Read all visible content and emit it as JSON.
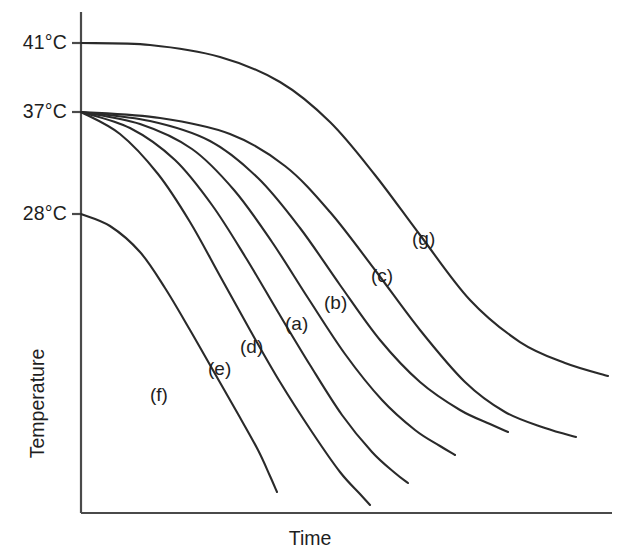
{
  "figure": {
    "background_color": "#ffffff",
    "line_color": "#2a2a2a",
    "axis_color": "#4a4a4a"
  },
  "axes": {
    "x_title": "Time",
    "y_title": "Temperature",
    "y_ticks": [
      {
        "label": "41°C",
        "y": 43
      },
      {
        "label": "37°C",
        "y": 112
      },
      {
        "label": "28°C",
        "y": 214
      }
    ]
  },
  "curve_labels": [
    {
      "name": "f",
      "text": "(f)",
      "x": 150,
      "y": 384
    },
    {
      "name": "e",
      "text": "(e)",
      "x": 208,
      "y": 358
    },
    {
      "name": "d",
      "text": "(d)",
      "x": 240,
      "y": 336
    },
    {
      "name": "a",
      "text": "(a)",
      "x": 285,
      "y": 313
    },
    {
      "name": "b",
      "text": "(b)",
      "x": 324,
      "y": 292
    },
    {
      "name": "c",
      "text": "(c)",
      "x": 371,
      "y": 265
    },
    {
      "name": "g",
      "text": "(g)",
      "x": 412,
      "y": 228
    }
  ],
  "chart_data": {
    "type": "line",
    "title": "",
    "xlabel": "Time",
    "ylabel": "Temperature",
    "grid": false,
    "legend": "inline-curve-labels",
    "x_axis": {
      "min_px": 81,
      "max_px": 612,
      "ticks": [],
      "note": "Time axis is unlabeled/qualitative"
    },
    "y_axis": {
      "tick_labels": [
        "41°C",
        "37°C",
        "28°C"
      ],
      "tick_values": [
        41,
        37,
        28
      ],
      "tick_pixels": [
        43,
        112,
        214
      ],
      "note": "Temperature axis, decreasing downward"
    },
    "series": [
      {
        "name": "g",
        "label": "(g)",
        "start_temp_label": "41°C",
        "start_temp": 41,
        "points_px": [
          [
            81,
            43
          ],
          [
            150,
            45
          ],
          [
            220,
            57
          ],
          [
            280,
            82
          ],
          [
            330,
            122
          ],
          [
            375,
            175
          ],
          [
            420,
            235
          ],
          [
            470,
            300
          ],
          [
            520,
            342
          ],
          [
            565,
            363
          ],
          [
            608,
            376
          ]
        ]
      },
      {
        "name": "c",
        "label": "(c)",
        "start_temp_label": "37°C",
        "start_temp": 37,
        "points_px": [
          [
            81,
            112
          ],
          [
            160,
            118
          ],
          [
            230,
            134
          ],
          [
            285,
            166
          ],
          [
            330,
            212
          ],
          [
            375,
            270
          ],
          [
            420,
            330
          ],
          [
            465,
            382
          ],
          [
            505,
            412
          ],
          [
            545,
            428
          ],
          [
            576,
            437
          ]
        ]
      },
      {
        "name": "b",
        "label": "(b)",
        "start_temp_label": "37°C",
        "start_temp": 37,
        "points_px": [
          [
            81,
            112
          ],
          [
            150,
            121
          ],
          [
            210,
            141
          ],
          [
            258,
            178
          ],
          [
            300,
            228
          ],
          [
            340,
            285
          ],
          [
            380,
            340
          ],
          [
            420,
            382
          ],
          [
            460,
            410
          ],
          [
            490,
            424
          ],
          [
            508,
            432
          ]
        ]
      },
      {
        "name": "a",
        "label": "(a)",
        "start_temp_label": "37°C",
        "start_temp": 37,
        "points_px": [
          [
            81,
            112
          ],
          [
            140,
            124
          ],
          [
            192,
            149
          ],
          [
            234,
            190
          ],
          [
            272,
            242
          ],
          [
            308,
            298
          ],
          [
            345,
            354
          ],
          [
            382,
            400
          ],
          [
            415,
            430
          ],
          [
            440,
            446
          ],
          [
            455,
            455
          ]
        ]
      },
      {
        "name": "d",
        "label": "(d)",
        "start_temp_label": "37°C",
        "start_temp": 37,
        "points_px": [
          [
            81,
            112
          ],
          [
            130,
            128
          ],
          [
            175,
            160
          ],
          [
            212,
            205
          ],
          [
            246,
            258
          ],
          [
            278,
            312
          ],
          [
            310,
            365
          ],
          [
            342,
            415
          ],
          [
            372,
            452
          ],
          [
            395,
            473
          ],
          [
            408,
            483
          ]
        ]
      },
      {
        "name": "e",
        "label": "(e)",
        "start_temp_label": "37°C",
        "start_temp": 37,
        "points_px": [
          [
            81,
            112
          ],
          [
            120,
            134
          ],
          [
            158,
            174
          ],
          [
            190,
            222
          ],
          [
            220,
            276
          ],
          [
            250,
            330
          ],
          [
            280,
            382
          ],
          [
            312,
            432
          ],
          [
            340,
            472
          ],
          [
            360,
            494
          ],
          [
            370,
            505
          ]
        ]
      },
      {
        "name": "f",
        "label": "(f)",
        "start_temp_label": "28°C",
        "start_temp": 28,
        "points_px": [
          [
            81,
            214
          ],
          [
            110,
            226
          ],
          [
            140,
            252
          ],
          [
            165,
            288
          ],
          [
            190,
            330
          ],
          [
            214,
            372
          ],
          [
            238,
            414
          ],
          [
            258,
            450
          ],
          [
            270,
            476
          ],
          [
            277,
            492
          ]
        ]
      }
    ]
  }
}
